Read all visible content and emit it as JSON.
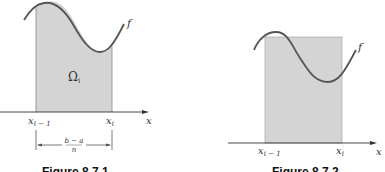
{
  "figures": [
    {
      "id": "left",
      "caption": "Figure 8.7.1",
      "function_label": "f",
      "region_label": "Ω",
      "region_subscript": "i",
      "x_left_label": "x",
      "x_left_sub": "i − 1",
      "x_right_label": "x",
      "x_right_sub": "i",
      "axis_label": "x",
      "width_numerator": "b − a",
      "width_denominator": "n"
    },
    {
      "id": "right",
      "caption": "Figure 8.7.2",
      "function_label": "f",
      "x_left_label": "x",
      "x_left_sub": "i − 1",
      "x_right_label": "x",
      "x_right_sub": "i",
      "axis_label": "x"
    }
  ],
  "colors": {
    "shade": "#d4d4d4",
    "curve": "#555555",
    "axis": "#333333"
  }
}
